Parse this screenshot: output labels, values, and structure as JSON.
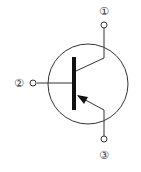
{
  "diagram": {
    "type": "transistor-symbol",
    "polarity": "PNP",
    "stroke_color": "#222222",
    "terminals": [
      {
        "id": "collector",
        "label": "①"
      },
      {
        "id": "base",
        "label": "②"
      },
      {
        "id": "emitter",
        "label": "③"
      }
    ]
  }
}
